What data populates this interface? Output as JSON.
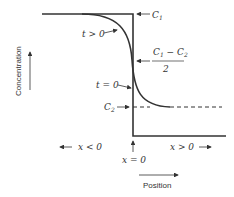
{
  "diagram": {
    "y_axis_label": "Concentration",
    "x_axis_label": "Position",
    "labels": {
      "c1": "C",
      "c1_sub": "1",
      "midpoint_num_a": "C",
      "midpoint_num_a_sub": "1",
      "midpoint_minus": " − C",
      "midpoint_num_b_sub": "2",
      "midpoint_den": "2",
      "c2": "C",
      "c2_sub": "2",
      "t_gt_0": "t > 0",
      "t_eq_0": "t = 0",
      "x_lt_0": "x < 0",
      "x_gt_0": "x > 0",
      "x_eq_0": "x = 0"
    },
    "colors": {
      "line": "#333333"
    }
  }
}
